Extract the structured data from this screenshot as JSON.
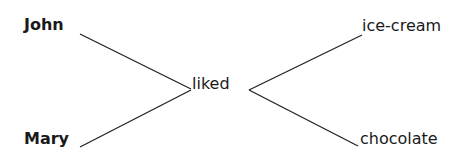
{
  "diagram": {
    "type": "dependency-tree",
    "nodes": {
      "john": "John",
      "mary": "Mary",
      "liked": "liked",
      "ice_cream": "ice-cream",
      "chocolate": "chocolate"
    },
    "edges": [
      {
        "from": "John",
        "to": "liked"
      },
      {
        "from": "Mary",
        "to": "liked"
      },
      {
        "from": "liked",
        "to": "ice-cream"
      },
      {
        "from": "liked",
        "to": "chocolate"
      }
    ],
    "line_color": "#222222"
  }
}
